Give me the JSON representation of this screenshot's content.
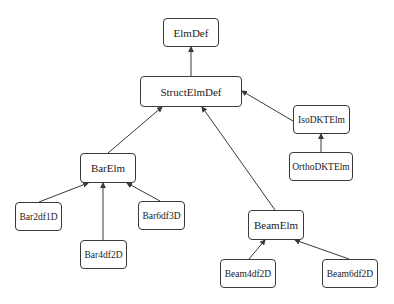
{
  "diagram": {
    "type": "class-hierarchy",
    "nodes": [
      {
        "id": "ElmDef",
        "label": "ElmDef"
      },
      {
        "id": "StructElmDef",
        "label": "StructElmDef"
      },
      {
        "id": "IsoDKTElm",
        "label": "IsoDKTElm"
      },
      {
        "id": "OrthoDKTElm",
        "label": "OrthoDKTElm"
      },
      {
        "id": "BarElm",
        "label": "BarElm"
      },
      {
        "id": "Bar2df1D",
        "label": "Bar2df1D"
      },
      {
        "id": "Bar4df2D",
        "label": "Bar4df2D"
      },
      {
        "id": "Bar6df3D",
        "label": "Bar6df3D"
      },
      {
        "id": "BeamElm",
        "label": "BeamElm"
      },
      {
        "id": "Beam4df2D",
        "label": "Beam4df2D"
      },
      {
        "id": "Beam6df2D",
        "label": "Beam6df2D"
      }
    ],
    "edges": [
      {
        "from": "StructElmDef",
        "to": "ElmDef"
      },
      {
        "from": "IsoDKTElm",
        "to": "StructElmDef"
      },
      {
        "from": "OrthoDKTElm",
        "to": "IsoDKTElm"
      },
      {
        "from": "BarElm",
        "to": "StructElmDef"
      },
      {
        "from": "BeamElm",
        "to": "StructElmDef"
      },
      {
        "from": "Bar2df1D",
        "to": "BarElm"
      },
      {
        "from": "Bar4df2D",
        "to": "BarElm"
      },
      {
        "from": "Bar6df3D",
        "to": "BarElm"
      },
      {
        "from": "Beam4df2D",
        "to": "BeamElm"
      },
      {
        "from": "Beam6df2D",
        "to": "BeamElm"
      }
    ],
    "colors": {
      "line": "#3a3a3a",
      "box_border": "#3a3a3a",
      "background": "#ffffff",
      "text": "#1a1a1a"
    }
  }
}
